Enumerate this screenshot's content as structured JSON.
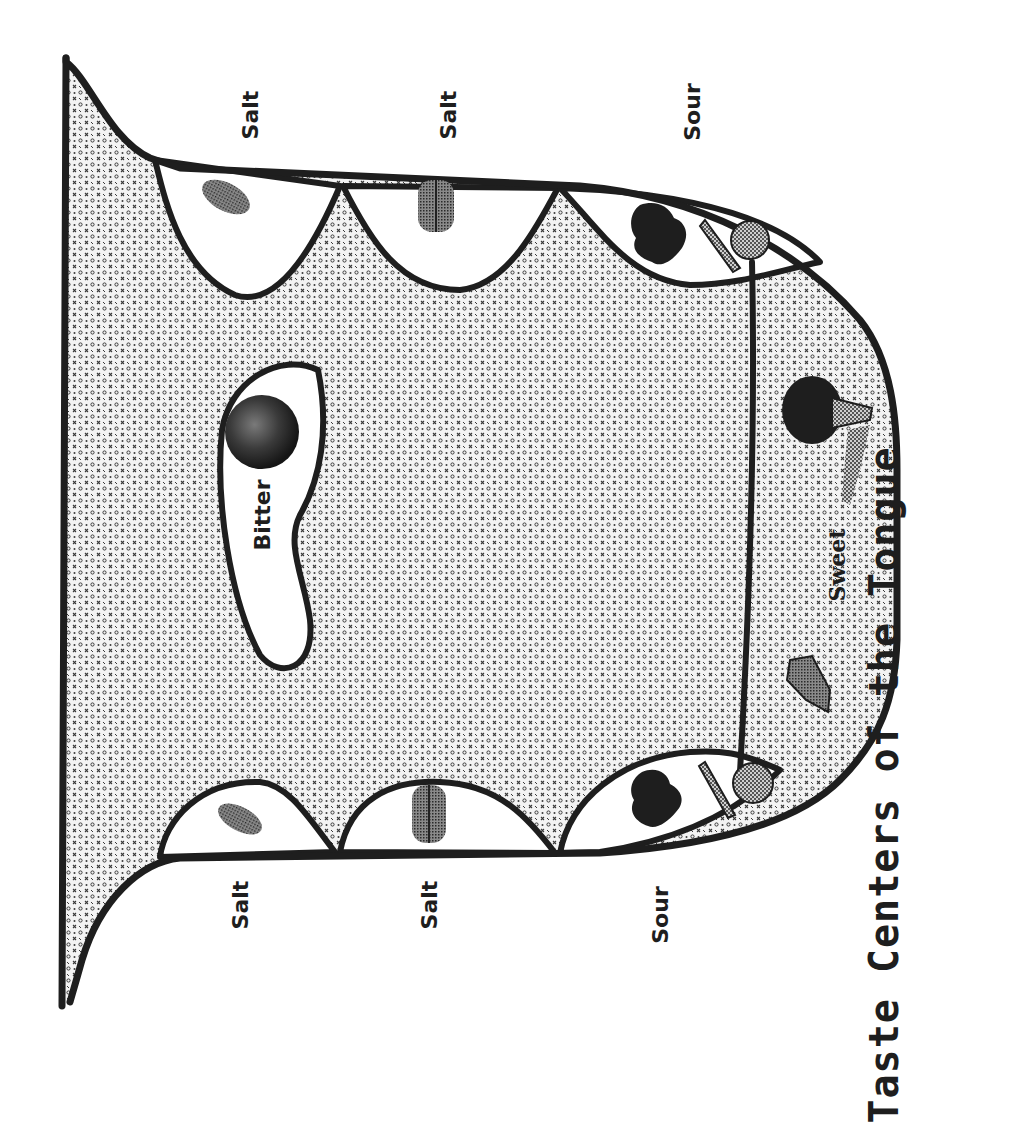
{
  "title": "Taste Centers of the Tongue",
  "colors": {
    "ink": "#1e1e1e",
    "background": "#ffffff",
    "tongue_fill_base": "#d8d8d8",
    "pocket_fill": "#ffffff"
  },
  "regions": {
    "top_side": [
      {
        "label": "Salt",
        "icon": "salt-grain-icon"
      },
      {
        "label": "Salt",
        "icon": "salt-shaker-icon"
      },
      {
        "label": "Sour",
        "icon": "sour-fruit-icon"
      }
    ],
    "bottom_side": [
      {
        "label": "Salt",
        "icon": "salt-grain-icon"
      },
      {
        "label": "Salt",
        "icon": "salt-shaker-icon"
      },
      {
        "label": "Sour",
        "icon": "sour-fruit-icon"
      }
    ],
    "back": {
      "label": "Bitter",
      "icon": "bitter-ball-icon"
    },
    "tip": {
      "label": "Sweet",
      "icon": "ice-cream-cone-icon"
    }
  },
  "labels": {
    "salt_top_1": "Salt",
    "salt_top_2": "Salt",
    "sour_top": "Sour",
    "salt_bottom_1": "Salt",
    "salt_bottom_2": "Salt",
    "sour_bottom": "Sour",
    "bitter": "Bitter",
    "sweet": "Sweet"
  }
}
